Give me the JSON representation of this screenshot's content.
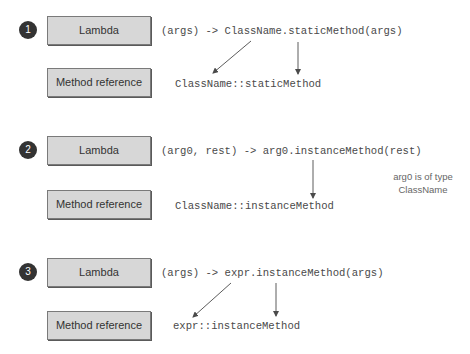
{
  "diagram": {
    "rows": [
      {
        "number": "1",
        "lambda_label": "Lambda",
        "method_ref_label": "Method reference",
        "lambda_expr": "(args) -> ClassName.staticMethod(args)",
        "method_ref_expr": "ClassName::staticMethod"
      },
      {
        "number": "2",
        "lambda_label": "Lambda",
        "method_ref_label": "Method reference",
        "lambda_expr": "(arg0, rest) -> arg0.instanceMethod(rest)",
        "method_ref_expr": "ClassName::instanceMethod",
        "note": [
          "arg0 is of type",
          "ClassName"
        ]
      },
      {
        "number": "3",
        "lambda_label": "Lambda",
        "method_ref_label": "Method reference",
        "lambda_expr": "(args) -> expr.instanceMethod(args)",
        "method_ref_expr": "expr::instanceMethod"
      }
    ],
    "colors": {
      "badge_fill": "#333333",
      "box_fill": "#d7d7d7",
      "box_border": "#7a7a7a",
      "code_text": "#4a4a4a",
      "arrow": "#4a4a4a",
      "note_text": "#666666"
    }
  }
}
